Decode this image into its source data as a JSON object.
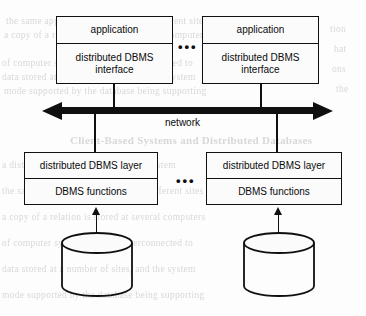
{
  "figure": {
    "background_color": "#fdfdfd",
    "stroke_color": "#101010"
  },
  "bleed_text": {
    "lines": [
      "the same application may be run at different sites",
      "a copy of a relation is stored at several computers",
      "of computer systems that are interconnected to",
      "data stored at a number of sites, and the system",
      "mode supported by the database being supporting",
      "a distributed database management system"
    ],
    "heading": "Client-Based Systems and Distributed Databases",
    "right_lines": [
      "tion",
      "hat",
      "ons",
      "the",
      "ata"
    ]
  },
  "nodes": [
    {
      "id": "node-left",
      "top_label": "application",
      "bottom_label": "distributed DBMS\ninterface",
      "layer_label": "distributed DBMS layer",
      "functions_label": "DBMS functions",
      "datastore_label": "database"
    },
    {
      "id": "node-right",
      "top_label": "application",
      "bottom_label": "distributed DBMS\ninterface",
      "layer_label": "distributed DBMS layer",
      "functions_label": "DBMS functions",
      "datastore_label": "database"
    }
  ],
  "network": {
    "label": "network",
    "arrow": "double-headed"
  },
  "ellipsis": {
    "upper": "•••",
    "lower": "•••"
  }
}
